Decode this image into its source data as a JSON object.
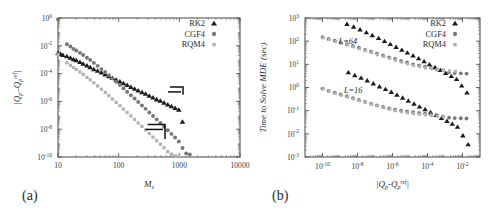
{
  "figure": {
    "background": "#ffffff",
    "panels": [
      {
        "tag": "(a)",
        "name": "convergence-panel",
        "xlabel": "M",
        "xlabel_sub": "s",
        "ylabel_parts": [
          "|Q",
          "p",
          "–Q",
          "p",
          "ref",
          "|"
        ],
        "ylabel_plain": "|Qp-Qpref|",
        "xticks": [
          "10",
          "100",
          "1000",
          "10000"
        ],
        "xtick_values": [
          10,
          100,
          1000,
          10000
        ],
        "yticks": [
          "0",
          "-2",
          "-4",
          "-6",
          "-8",
          "-10"
        ],
        "ytick_values": [
          0,
          -2,
          -4,
          -6,
          -8,
          -10
        ],
        "legend": [
          "RK2",
          "CGF4",
          "RQM4"
        ]
      },
      {
        "tag": "(b)",
        "name": "timing-panel",
        "xlabel_plain": "|Qp-Qpref|",
        "ylabel": "Time to Solve MDE (sec)",
        "xticks": [
          "-10",
          "-8",
          "-6",
          "-4",
          "-2"
        ],
        "xtick_values": [
          -10,
          -8,
          -6,
          -4,
          -2
        ],
        "yticks": [
          "3",
          "2",
          "1",
          "0",
          "-1",
          "-2",
          "-3"
        ],
        "ytick_values": [
          3,
          2,
          1,
          0,
          -1,
          -2,
          -3
        ],
        "legend": [
          "RK2",
          "CGF4",
          "RQM4"
        ],
        "annotations": [
          {
            "text": "L=64",
            "x": -8.55,
            "y": 1.86
          },
          {
            "text": "L=16",
            "x": -8.25,
            "y": -0.22
          }
        ]
      }
    ]
  },
  "series_style": {
    "RK2": {
      "marker": "triangle",
      "color": "#1c1c1c"
    },
    "CGF4": {
      "marker": "circle",
      "color": "#777777"
    },
    "RQM4": {
      "marker": "square",
      "color": "#b2b2b2"
    }
  },
  "chart_data": [
    {
      "type": "scatter",
      "id": "panel-a",
      "title": "",
      "xlabel": "M_s",
      "ylabel": "|Q_p - Q_p^ref|",
      "xscale": "log",
      "yscale": "log",
      "xlim": [
        10,
        10000
      ],
      "ylim": [
        1e-10,
        1
      ],
      "grid": false,
      "legend_position": "top-right",
      "annotations": [
        {
          "type": "slope-guide",
          "label": "RK2 slope guide",
          "x0": 700,
          "y0": 1.1e-05,
          "x1": 1150,
          "y1": 1.1e-05,
          "x2": 1150,
          "y2": 3e-06
        },
        {
          "type": "slope-guide",
          "label": "CGF4/RQM4 slope guide",
          "x0": 300,
          "y0": 2.2e-08,
          "x1": 580,
          "y1": 2.2e-08,
          "x2": 580,
          "y2": 2e-09
        }
      ],
      "series": [
        {
          "name": "RK2",
          "x": [
            10,
            11,
            12,
            14,
            16,
            18,
            20,
            23,
            26,
            30,
            34,
            39,
            45,
            52,
            60,
            69,
            79,
            91,
            105,
            120,
            138,
            159,
            183,
            210,
            242,
            278,
            320,
            368,
            423,
            487,
            560,
            644,
            741,
            852,
            980,
            1127
          ],
          "y": [
            0.003,
            0.0026,
            0.0022,
            0.0018,
            0.0014,
            0.0011,
            0.0009,
            0.00068,
            0.00052,
            0.00038,
            0.00029,
            0.00021,
            0.00016,
            0.00012,
            8.7e-05,
            6.5e-05,
            4.9e-05,
            3.6e-05,
            2.7e-05,
            2e-05,
            1.5e-05,
            1.1e-05,
            8.3e-06,
            6.2e-06,
            4.6e-06,
            3.5e-06,
            2.6e-06,
            1.9e-06,
            1.4e-06,
            1.1e-06,
            8e-07,
            6e-07,
            4.5e-07,
            3.4e-07,
            2.5e-07,
            3.4e-08
          ]
        },
        {
          "name": "CGF4",
          "x": [
            10,
            14,
            16,
            18,
            20,
            23,
            26,
            30,
            34,
            39,
            45,
            52,
            60,
            69,
            79,
            91,
            105,
            120,
            138,
            159,
            183,
            210,
            242,
            278,
            320,
            368,
            423,
            487,
            560,
            644,
            741,
            852,
            980,
            1127,
            1296,
            1490
          ],
          "y": [
            0.8,
            0.013,
            0.009,
            0.006,
            0.0046,
            0.0031,
            0.0022,
            0.0014,
            0.00095,
            0.00059,
            0.00036,
            0.00021,
            0.00013,
            7.6e-05,
            4.5e-05,
            2.6e-05,
            1.5e-05,
            8.6e-06,
            4.9e-06,
            2.8e-06,
            1.6e-06,
            9e-07,
            5.1e-07,
            2.9e-07,
            1.6e-07,
            9e-08,
            5.1e-08,
            2.8e-08,
            1.5e-08,
            8.5e-09,
            4.6e-09,
            2.5e-09,
            1.3e-09,
            4.5e-10,
            1.8e-10,
            1.5e-10
          ]
        },
        {
          "name": "RQM4",
          "x": [
            10,
            14,
            16,
            18,
            20,
            23,
            26,
            30,
            34,
            39,
            45,
            52,
            60,
            69,
            79,
            91,
            105,
            120,
            138,
            159,
            183,
            210,
            242,
            278,
            320,
            368,
            423,
            487,
            560,
            644,
            741,
            852,
            980
          ],
          "y": [
            0.0024,
            0.0006,
            0.0004,
            0.00027,
            0.0002,
            0.00013,
            8.7e-05,
            5.4e-05,
            3.6e-05,
            2.2e-05,
            1.3e-05,
            7.5e-06,
            4.4e-06,
            2.6e-06,
            1.5e-06,
            8.5e-07,
            4.9e-07,
            2.8e-07,
            1.6e-07,
            9e-08,
            5e-08,
            2.8e-08,
            1.6e-08,
            8.8e-09,
            4.9e-09,
            2.7e-09,
            1.5e-09,
            8.3e-10,
            4.6e-10,
            2.5e-10,
            1.6e-10,
            1.2e-10,
            1.05e-10
          ]
        }
      ]
    },
    {
      "type": "scatter",
      "id": "panel-b",
      "title": "",
      "xlabel": "|Q_p - Q_p^ref|",
      "ylabel": "Time to Solve MDE (sec)",
      "xscale": "log",
      "yscale": "log",
      "xlim": [
        1e-11,
        0.1
      ],
      "ylim": [
        0.001,
        1000.0
      ],
      "grid": false,
      "legend_position": "top-right",
      "groups": [
        "L=64",
        "L=16"
      ],
      "series": [
        {
          "name": "RK2",
          "group": "L=64",
          "x": [
            2.5e-09,
            6e-09,
            1.4e-08,
            3.2e-08,
            7e-08,
            1.6e-07,
            3.5e-07,
            7.5e-07,
            1.6e-06,
            3.4e-06,
            7e-06,
            1.5e-05,
            3.1e-05,
            6.4e-05,
            0.00013,
            0.00027,
            0.00055,
            0.0011,
            0.0023,
            0.0046,
            0.009,
            0.018
          ],
          "y": [
            550.0,
            420.0,
            320.0,
            240.0,
            180.0,
            135.0,
            100.0,
            75,
            56,
            42,
            32,
            24,
            18,
            13.5,
            10,
            7.5,
            5.6,
            4.2,
            3.1,
            2.3,
            1.2,
            0.6
          ]
        },
        {
          "name": "CGF4",
          "group": "L=64",
          "x": [
            1e-10,
            2.2e-10,
            5e-10,
            1.1e-09,
            2.5e-09,
            5.5e-09,
            1.2e-08,
            2.7e-08,
            6e-08,
            1.3e-07,
            2.9e-07,
            6.4e-07,
            1.4e-06,
            3.1e-06,
            6.8e-06,
            1.5e-05,
            3.3e-05,
            7.2e-05,
            0.00016,
            0.00035,
            0.00076,
            0.0017,
            0.0036,
            0.008,
            0.017
          ],
          "y": [
            150.0,
            125.0,
            105.0,
            88,
            74,
            62,
            52,
            42,
            35,
            29,
            24,
            20,
            17,
            14,
            12,
            10,
            9,
            8,
            7,
            6,
            5.5,
            4.5,
            4.2,
            4.1,
            4.0
          ]
        },
        {
          "name": "RQM4",
          "group": "L=64",
          "x": [
            1.1e-10,
            2.4e-10,
            5.5e-10,
            1.2e-09,
            2.7e-09,
            6e-09,
            1.3e-08,
            2.9e-08,
            6.5e-08,
            1.4e-07,
            3.2e-07,
            7e-07,
            1.5e-06,
            3.4e-06,
            7.4e-06,
            1.6e-05,
            3.6e-05,
            7.8e-05,
            0.00017,
            0.00038,
            0.00082,
            0.0018,
            0.004
          ],
          "y": [
            140.0,
            118.0,
            98,
            82,
            68,
            57,
            47,
            39,
            32,
            26,
            22,
            18,
            15,
            12.5,
            10.5,
            9,
            8,
            7,
            6.5,
            6,
            5.5,
            5.2,
            5.0
          ]
        },
        {
          "name": "RK2",
          "group": "L=16",
          "x": [
            3e-09,
            7e-09,
            1.6e-08,
            3.6e-08,
            8e-08,
            1.8e-07,
            4e-07,
            8.5e-07,
            1.8e-06,
            3.8e-06,
            8e-06,
            1.7e-05,
            3.5e-05,
            7.3e-05,
            0.00015,
            0.00031,
            0.00063,
            0.0013,
            0.0026,
            0.0052,
            0.0105,
            0.021
          ],
          "y": [
            4.5,
            3.4,
            2.6,
            2.0,
            1.5,
            1.1,
            0.85,
            0.64,
            0.48,
            0.36,
            0.27,
            0.2,
            0.15,
            0.115,
            0.086,
            0.064,
            0.048,
            0.036,
            0.027,
            0.02,
            0.0085,
            0.0035
          ]
        },
        {
          "name": "CGF4",
          "group": "L=16",
          "x": [
            1e-10,
            2.2e-10,
            5e-10,
            1.1e-09,
            2.5e-09,
            5.5e-09,
            1.2e-08,
            2.7e-08,
            6e-08,
            1.3e-07,
            2.9e-07,
            6.4e-07,
            1.4e-06,
            3.1e-06,
            6.8e-06,
            1.5e-05,
            3.3e-05,
            7.2e-05,
            0.00016,
            0.00035,
            0.00076,
            0.0017,
            0.0036,
            0.008,
            0.017
          ],
          "y": [
            0.9,
            0.72,
            0.6,
            0.5,
            0.42,
            0.35,
            0.29,
            0.24,
            0.2,
            0.17,
            0.145,
            0.125,
            0.11,
            0.1,
            0.092,
            0.086,
            0.08,
            0.075,
            0.07,
            0.062,
            0.056,
            0.05,
            0.048,
            0.047,
            0.046
          ]
        },
        {
          "name": "RQM4",
          "group": "L=16",
          "x": [
            1.1e-10,
            2.4e-10,
            5.5e-10,
            1.2e-09,
            2.7e-09,
            6e-09,
            1.3e-08,
            2.9e-08,
            6.5e-08,
            1.4e-07,
            3.2e-07,
            7e-07,
            1.5e-06,
            3.4e-06,
            7.4e-06,
            1.6e-05,
            3.6e-05,
            7.8e-05,
            0.00017,
            0.00038,
            0.00082
          ],
          "y": [
            0.88,
            0.7,
            0.57,
            0.47,
            0.39,
            0.325,
            0.27,
            0.225,
            0.19,
            0.16,
            0.135,
            0.115,
            0.1,
            0.09,
            0.082,
            0.075,
            0.07,
            0.066,
            0.062,
            0.058,
            0.056
          ]
        }
      ]
    }
  ]
}
